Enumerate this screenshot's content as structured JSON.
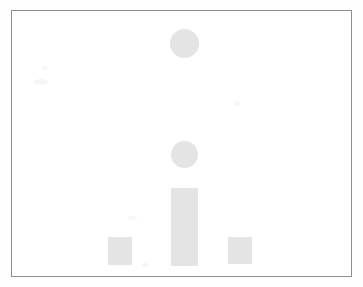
{
  "figure": {
    "frame": {
      "x": 11,
      "y": 10,
      "width": 341,
      "height": 267,
      "border_color": "#8e8e8e",
      "background": "#ffffff"
    },
    "page_background": "#fefefe",
    "mark_color": "#e4e4e4"
  },
  "chart_data": {
    "type": "bar",
    "title": "",
    "subtitle": "",
    "xlabel": "",
    "ylabel": "",
    "categories": [
      "",
      "",
      ""
    ],
    "tick_labels": [],
    "legend": [],
    "grid": false,
    "legend_position": "none",
    "axis_visible": false,
    "baseline_y": 254,
    "ylim": [
      0,
      267
    ],
    "values": [
      28,
      78,
      28
    ],
    "series": [
      {
        "name": "bars",
        "values": [
          28,
          78,
          28
        ]
      }
    ],
    "marks": [
      {
        "id": "marker-upper",
        "shape": "circle",
        "x": 158,
        "y": 18,
        "width": 29,
        "height": 29,
        "color": "#e4e4e4"
      },
      {
        "id": "marker-lower",
        "shape": "circle",
        "x": 159,
        "y": 130,
        "width": 27,
        "height": 27,
        "color": "#e4e4e4"
      },
      {
        "id": "bar-center",
        "shape": "bar",
        "x": 159,
        "y": 177,
        "width": 27,
        "height": 78,
        "color": "#e4e4e4"
      },
      {
        "id": "bar-left",
        "shape": "bar",
        "x": 96,
        "y": 226,
        "width": 24,
        "height": 28,
        "color": "#e4e4e4"
      },
      {
        "id": "bar-right",
        "shape": "bar",
        "x": 216,
        "y": 226,
        "width": 24,
        "height": 27,
        "color": "#e4e4e4"
      }
    ],
    "annotations": []
  }
}
